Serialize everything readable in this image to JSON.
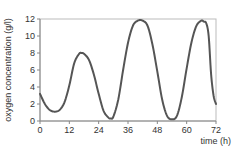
{
  "chart_data": {
    "type": "line",
    "title": "",
    "xlabel": "time (h)",
    "ylabel": "oxygen concentration (g/l)",
    "xlim": [
      0,
      72
    ],
    "ylim": [
      0,
      12
    ],
    "xticks": [
      0,
      12,
      24,
      36,
      48,
      60,
      72
    ],
    "yticks": [
      0,
      2,
      4,
      6,
      8,
      10,
      12
    ],
    "grid": false,
    "legend": null,
    "series": [
      {
        "name": "oxygen concentration",
        "color": "#555555",
        "x": [
          0,
          2,
          4,
          6,
          8,
          10,
          12,
          14,
          16,
          17,
          18,
          20,
          22,
          24,
          26,
          28,
          29,
          30,
          32,
          34,
          36,
          38,
          40,
          42,
          44,
          46,
          48,
          50,
          52,
          54,
          56,
          58,
          60,
          62,
          64,
          66,
          67,
          68,
          69,
          70,
          71,
          72
        ],
        "y": [
          3.2,
          2.0,
          1.3,
          1.1,
          1.3,
          2.2,
          4.2,
          6.8,
          7.9,
          8.0,
          7.9,
          7.2,
          5.5,
          3.2,
          1.2,
          0.4,
          0.3,
          0.5,
          2.5,
          6.0,
          9.2,
          11.2,
          11.8,
          11.8,
          11.2,
          9.0,
          5.8,
          2.5,
          0.6,
          0.2,
          0.6,
          2.8,
          6.2,
          9.3,
          11.2,
          11.8,
          11.7,
          11.5,
          10.0,
          5.5,
          3.0,
          2.0
        ]
      }
    ]
  }
}
